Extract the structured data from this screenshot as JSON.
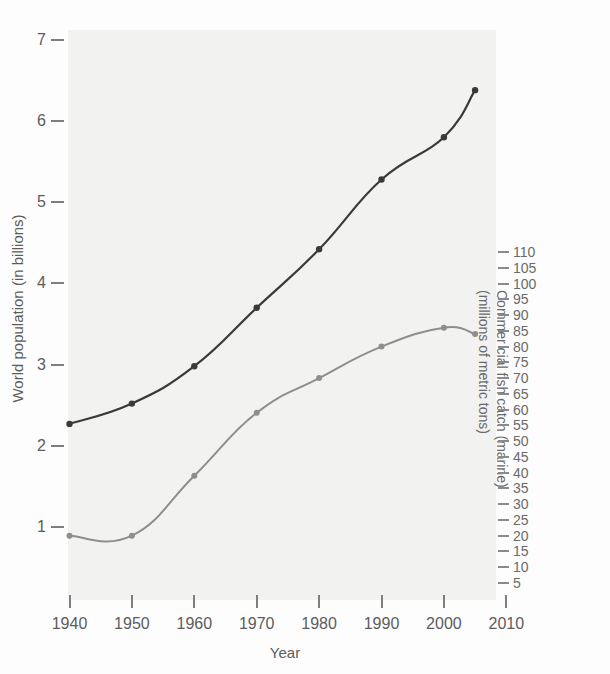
{
  "chart_data": {
    "type": "line",
    "title": "",
    "xlabel": "Year",
    "x": [
      1940,
      1950,
      1960,
      1970,
      1980,
      1990,
      2000,
      2005
    ],
    "xticks": [
      1940,
      1950,
      1960,
      1970,
      1980,
      1990,
      2000,
      2010
    ],
    "xlim": [
      1940,
      2010
    ],
    "grid": false,
    "legend": "none",
    "axes": [
      {
        "id": "left",
        "label": "World population (in billions)",
        "ticks": [
          1,
          2,
          3,
          4,
          5,
          6,
          7
        ],
        "lim": [
          0,
          7.4
        ],
        "position": "left"
      },
      {
        "id": "right",
        "label_lines": [
          "Commer cial fish catch (marine)",
          "(millions of metric tons)"
        ],
        "label": "Commer cial fish catch (marine) (millions of metric tons)",
        "ticks": [
          5,
          10,
          15,
          20,
          25,
          30,
          35,
          40,
          45,
          50,
          55,
          60,
          65,
          70,
          75,
          80,
          85,
          90,
          95,
          100,
          105,
          110
        ],
        "lim": [
          0,
          115
        ],
        "position": "right"
      }
    ],
    "series": [
      {
        "name": "World population (in billions)",
        "axis": "left",
        "color": "#3a3a3a",
        "marker": "circle",
        "x": [
          1940,
          1950,
          1960,
          1970,
          1980,
          1990,
          2000,
          2005
        ],
        "values": [
          2.27,
          2.52,
          2.98,
          3.7,
          4.42,
          5.28,
          5.8,
          6.38
        ]
      },
      {
        "name": "Commercial fish catch (marine, millions of metric tons)",
        "axis": "right",
        "color": "#8e8e8e",
        "marker": "circle",
        "x": [
          1940,
          1950,
          1960,
          1970,
          1980,
          1990,
          2000,
          2005
        ],
        "values": [
          20,
          20,
          39,
          59,
          70,
          80,
          86,
          84
        ]
      }
    ]
  },
  "axis_left": {
    "label": "World population (in billions)",
    "ticks": [
      "7",
      "6",
      "5",
      "4",
      "3",
      "2",
      "1"
    ]
  },
  "axis_right": {
    "label_line1": "Commer cial fish catch (marine)",
    "label_line2": "(millions of metric tons)",
    "ticks": [
      "110",
      "105",
      "100",
      "95",
      "90",
      "85",
      "80",
      "75",
      "70",
      "65",
      "60",
      "55",
      "50",
      "45",
      "40",
      "35",
      "30",
      "25",
      "20",
      "15",
      "10",
      "5"
    ]
  },
  "axis_bottom": {
    "label": "Year",
    "ticks": [
      "1940",
      "1950",
      "1960",
      "1970",
      "1980",
      "1990",
      "2000",
      "2010"
    ]
  },
  "colors": {
    "population_line": "#3a3a3a",
    "fish_line": "#8e8e8e",
    "panel": "#f2f2f1",
    "text": "#5c5c5c"
  }
}
